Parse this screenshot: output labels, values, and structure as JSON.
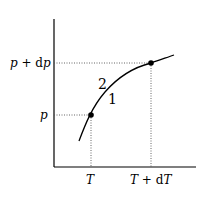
{
  "diagram": {
    "type": "phase-boundary-curve",
    "axes": {
      "x_ticks": [
        {
          "label_var": "T",
          "label": "T"
        },
        {
          "label_var": "T+dT",
          "label": "T + dT"
        }
      ],
      "y_ticks": [
        {
          "label_var": "p",
          "label": "p"
        },
        {
          "label_var": "p+dp",
          "label": "p + dp"
        }
      ]
    },
    "regions": {
      "above": "2",
      "below": "1"
    },
    "points": [
      {
        "name": "lower",
        "x_label": "T",
        "y_label": "p"
      },
      {
        "name": "upper",
        "x_label": "T + dT",
        "y_label": "p + dp"
      }
    ],
    "colors": {
      "line": "#000000",
      "dotted": "#555555",
      "background": "#ffffff"
    }
  }
}
